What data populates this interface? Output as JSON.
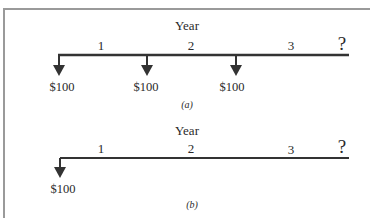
{
  "diagrams": [
    {
      "id": "a",
      "axis_title": "Year",
      "period_labels": [
        "1",
        "2",
        "3"
      ],
      "unknown_label": "?",
      "cash_flows": [
        {
          "period": 0,
          "amount": "$100",
          "direction": "down"
        },
        {
          "period": 1,
          "amount": "$100",
          "direction": "down"
        },
        {
          "period": 2,
          "amount": "$100",
          "direction": "down"
        }
      ],
      "caption": "(a)"
    },
    {
      "id": "b",
      "axis_title": "Year",
      "period_labels": [
        "1",
        "2",
        "3"
      ],
      "unknown_label": "?",
      "cash_flows": [
        {
          "period": 0,
          "amount": "$100",
          "direction": "down"
        }
      ],
      "caption": "(b)"
    }
  ],
  "colors": {
    "line": "#333333",
    "frame": "#9a9a9a"
  }
}
